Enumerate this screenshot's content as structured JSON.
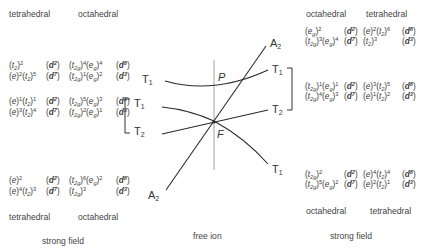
{
  "left": {
    "headers": {
      "tetrahedral": "tetrahedral",
      "octahedral": "octahedral"
    },
    "rows": [
      {
        "tet": [
          {
            "orb": "t",
            "sub": "2",
            "exp": "2"
          }
        ],
        "tet_d": "d",
        "tet_dn": "2",
        "oct": [
          {
            "orb": "t",
            "sub": "2g",
            "exp": "4"
          },
          {
            "orb": "e",
            "sub": "g",
            "exp": "4"
          }
        ],
        "oct_d": "d",
        "oct_dn": "8"
      },
      {
        "tet": [
          {
            "orb": "e",
            "sub": "",
            "exp": "2"
          },
          {
            "orb": "t",
            "sub": "2",
            "exp": "5"
          }
        ],
        "tet_d": "d",
        "tet_dn": "7",
        "oct": [
          {
            "orb": "t",
            "sub": "2g",
            "exp": "1"
          },
          {
            "orb": "e",
            "sub": "g",
            "exp": "2"
          }
        ],
        "oct_d": "d",
        "oct_dn": "3"
      },
      {
        "tet": [
          {
            "orb": "e",
            "sub": "",
            "exp": "1"
          },
          {
            "orb": "t",
            "sub": "2",
            "exp": "1"
          }
        ],
        "tet_d": "d",
        "tet_dn": "2",
        "oct": [
          {
            "orb": "t",
            "sub": "2g",
            "exp": "5"
          },
          {
            "orb": "e",
            "sub": "g",
            "exp": "3"
          }
        ],
        "oct_d": "d",
        "oct_dn": "8"
      },
      {
        "tet": [
          {
            "orb": "e",
            "sub": "",
            "exp": "3"
          },
          {
            "orb": "t",
            "sub": "2",
            "exp": "4"
          }
        ],
        "tet_d": "d",
        "tet_dn": "7",
        "oct": [
          {
            "orb": "t",
            "sub": "2g",
            "exp": "2"
          },
          {
            "orb": "e",
            "sub": "g",
            "exp": "1"
          }
        ],
        "oct_d": "d",
        "oct_dn": "3"
      },
      {
        "tet": [
          {
            "orb": "e",
            "sub": "",
            "exp": "2"
          }
        ],
        "tet_d": "d",
        "tet_dn": "2",
        "oct": [
          {
            "orb": "t",
            "sub": "2g",
            "exp": "6"
          },
          {
            "orb": "e",
            "sub": "g",
            "exp": "2"
          }
        ],
        "oct_d": "d",
        "oct_dn": "8"
      },
      {
        "tet": [
          {
            "orb": "e",
            "sub": "",
            "exp": "4"
          },
          {
            "orb": "t",
            "sub": "2",
            "exp": "3"
          }
        ],
        "tet_d": "d",
        "tet_dn": "7",
        "oct": [
          {
            "orb": "t",
            "sub": "2g",
            "exp": "3"
          }
        ],
        "oct_d": "d",
        "oct_dn": "3"
      }
    ],
    "footer_tetrahedral": "tetrahedral",
    "footer_octahedral": "octahedral",
    "caption": "strong field"
  },
  "right": {
    "headers": {
      "octahedral": "octahedral",
      "tetrahedral": "tetrahedral"
    },
    "rows": [
      {
        "oct": [
          {
            "orb": "e",
            "sub": "g",
            "exp": "2"
          }
        ],
        "oct_d": "d",
        "oct_dn": "2",
        "tet": [
          {
            "orb": "e",
            "sub": "",
            "exp": "2"
          },
          {
            "orb": "t",
            "sub": "2",
            "exp": "6"
          }
        ],
        "tet_d": "d",
        "tet_dn": "8"
      },
      {
        "oct": [
          {
            "orb": "t",
            "sub": "2g",
            "exp": "3"
          },
          {
            "orb": "e",
            "sub": "g",
            "exp": "4"
          }
        ],
        "oct_d": "d",
        "oct_dn": "7",
        "tet": [
          {
            "orb": "t",
            "sub": "2",
            "exp": "3"
          }
        ],
        "tet_d": "d",
        "tet_dn": "3"
      },
      {
        "oct": [
          {
            "orb": "t",
            "sub": "2g",
            "exp": "1"
          },
          {
            "orb": "e",
            "sub": "g",
            "exp": "1"
          }
        ],
        "oct_d": "d",
        "oct_dn": "2",
        "tet": [
          {
            "orb": "e",
            "sub": "",
            "exp": "3"
          },
          {
            "orb": "t",
            "sub": "2",
            "exp": "5"
          }
        ],
        "tet_d": "d",
        "tet_dn": "8"
      },
      {
        "oct": [
          {
            "orb": "t",
            "sub": "2g",
            "exp": "4"
          },
          {
            "orb": "e",
            "sub": "g",
            "exp": "3"
          }
        ],
        "oct_d": "d",
        "oct_dn": "7",
        "tet": [
          {
            "orb": "e",
            "sub": "",
            "exp": "1"
          },
          {
            "orb": "t",
            "sub": "2",
            "exp": "2"
          }
        ],
        "tet_d": "d",
        "tet_dn": "3"
      },
      {
        "oct": [
          {
            "orb": "t",
            "sub": "2g",
            "exp": "2"
          }
        ],
        "oct_d": "d",
        "oct_dn": "2",
        "tet": [
          {
            "orb": "e",
            "sub": "",
            "exp": "4"
          },
          {
            "orb": "t",
            "sub": "2",
            "exp": "4"
          }
        ],
        "tet_d": "d",
        "tet_dn": "8"
      },
      {
        "oct": [
          {
            "orb": "t",
            "sub": "2g",
            "exp": "5"
          },
          {
            "orb": "e",
            "sub": "g",
            "exp": "2"
          }
        ],
        "oct_d": "d",
        "oct_dn": "7",
        "tet": [
          {
            "orb": "e",
            "sub": "",
            "exp": "2"
          },
          {
            "orb": "t",
            "sub": "2",
            "exp": "1"
          }
        ],
        "tet_d": "d",
        "tet_dn": "3"
      }
    ],
    "footer_octahedral": "octahedral",
    "footer_tetrahedral": "tetrahedral",
    "caption": "strong field"
  },
  "center": {
    "caption": "free ion",
    "point_P": "P",
    "point_F": "F",
    "terms": {
      "left_T1_upper": {
        "base": "T",
        "sub": "1"
      },
      "left_T1_lower": {
        "base": "T",
        "sub": "1"
      },
      "left_T2": {
        "base": "T",
        "sub": "2"
      },
      "left_A2": {
        "base": "A",
        "sub": "2"
      },
      "right_A2": {
        "base": "A",
        "sub": "2"
      },
      "right_T1_upper": {
        "base": "T",
        "sub": "1"
      },
      "right_T2": {
        "base": "T",
        "sub": "2"
      },
      "right_T1_lower": {
        "base": "T",
        "sub": "1"
      }
    }
  },
  "colors": {
    "line": "#2b2b2b",
    "axis": "#7a7a7a",
    "text": "#3a3a3a"
  }
}
